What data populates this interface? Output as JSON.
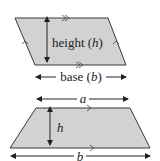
{
  "diagram": {
    "colors": {
      "fill": "#d2d2d2",
      "stroke": "#3a3a3a",
      "text": "#222222",
      "background": "#ffffff"
    },
    "parallelogram": {
      "height_label_prefix": "height (",
      "height_var": "h",
      "height_label_suffix": ")",
      "base_label_prefix": "base (",
      "base_var": "b",
      "base_label_suffix": ")",
      "parallel_marks": {
        "top_bottom": "double-chevron",
        "sides": "single-chevron"
      }
    },
    "trapezoid": {
      "top_label": "a",
      "height_label": "h",
      "bottom_label": "b",
      "parallel_marks": {
        "top_bottom": "single-chevron"
      }
    }
  }
}
